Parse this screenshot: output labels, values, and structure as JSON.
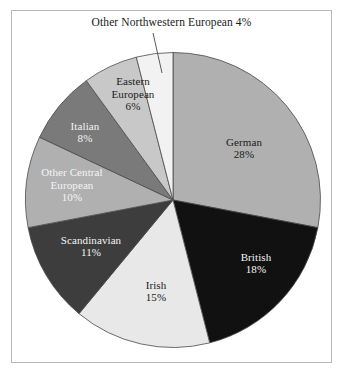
{
  "chart_data": {
    "type": "pie",
    "title": "",
    "categories": [
      "German",
      "British",
      "Irish",
      "Scandinavian",
      "Other Central European",
      "Italian",
      "Eastern European",
      "Other Northwestern European"
    ],
    "values": [
      28,
      18,
      15,
      11,
      10,
      8,
      6,
      4
    ],
    "unit": "%",
    "start_angle_deg": 0,
    "direction": "clockwise",
    "legend": "none",
    "grid": false,
    "colors": [
      "#b0b0b0",
      "#111111",
      "#e8e8e8",
      "#3d3d3d",
      "#b0b0b0",
      "#7a7a7a",
      "#c8c8c8",
      "#f2f2f2"
    ],
    "slices": [
      {
        "name": "German",
        "value": 28,
        "label": "German",
        "pct_label": "28%",
        "color": "#b0b0b0",
        "text_color": "dark",
        "placement": "inside"
      },
      {
        "name": "British",
        "value": 18,
        "label": "British",
        "pct_label": "18%",
        "color": "#111111",
        "text_color": "light",
        "placement": "inside"
      },
      {
        "name": "Irish",
        "value": 15,
        "label": "Irish",
        "pct_label": "15%",
        "color": "#e8e8e8",
        "text_color": "dark",
        "placement": "inside"
      },
      {
        "name": "Scandinavian",
        "value": 11,
        "label": "Scandinavian",
        "pct_label": "11%",
        "color": "#3d3d3d",
        "text_color": "light",
        "placement": "inside"
      },
      {
        "name": "Other Central European",
        "value": 10,
        "label": "Other Central European",
        "pct_label": "10%",
        "color": "#b0b0b0",
        "text_color": "light",
        "placement": "inside"
      },
      {
        "name": "Italian",
        "value": 8,
        "label": "Italian",
        "pct_label": "8%",
        "color": "#7a7a7a",
        "text_color": "light",
        "placement": "inside"
      },
      {
        "name": "Eastern European",
        "value": 6,
        "label": "Eastern European",
        "pct_label": "6%",
        "color": "#c8c8c8",
        "text_color": "dark",
        "placement": "inside"
      },
      {
        "name": "Other Northwestern European",
        "value": 4,
        "label": "Other Northwestern European",
        "pct_label": "4%",
        "color": "#f2f2f2",
        "text_color": "dark",
        "placement": "callout"
      }
    ]
  },
  "callout": {
    "text": "Other Northwestern European 4%"
  },
  "frame": {
    "border_color": "#b9b9b9",
    "background": "#ffffff"
  }
}
